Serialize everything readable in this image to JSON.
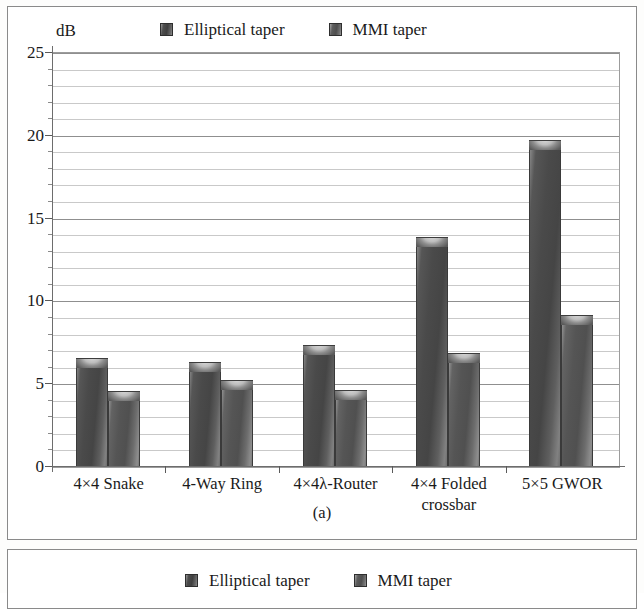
{
  "figure": {
    "subfigure_caption": "(a)",
    "unit_label": "dB"
  },
  "legend": {
    "entries": [
      {
        "label": "Elliptical taper",
        "swatch": "legend-swatch-elliptical",
        "color": "#4a4a4a"
      },
      {
        "label": "MMI taper",
        "swatch": "legend-swatch-mmi",
        "color": "#555555"
      }
    ]
  },
  "panel_b": {
    "legend": {
      "entries": [
        {
          "label": "Elliptical taper",
          "color": "#4a4a4a"
        },
        {
          "label": "MMI taper",
          "color": "#555555"
        }
      ]
    }
  },
  "chart_data": {
    "type": "bar",
    "title": "",
    "subtitle": "",
    "xlabel": "",
    "ylabel": "dB",
    "ylim": [
      0,
      25
    ],
    "yticks": [
      0,
      5,
      10,
      15,
      20,
      25
    ],
    "ytick_labels": [
      "0",
      "5",
      "10",
      "15",
      "20",
      "25"
    ],
    "minor_tick_interval": 1,
    "grid": true,
    "legend_position": "top",
    "categories": [
      "4×4 Snake",
      "4-Way Ring",
      "4×4λ-Router",
      "4×4 Folded crossbar",
      "5×5 GWOR"
    ],
    "category_lines": [
      [
        "4×4 Snake"
      ],
      [
        "4-Way Ring"
      ],
      [
        "4×4λ-Router"
      ],
      [
        "4×4 Folded",
        "crossbar"
      ],
      [
        "5×5 GWOR"
      ]
    ],
    "series": [
      {
        "name": "Elliptical taper",
        "values": [
          6.5,
          6.3,
          7.3,
          13.8,
          19.7
        ]
      },
      {
        "name": "MMI taper",
        "values": [
          4.5,
          5.2,
          4.6,
          6.8,
          9.1
        ]
      }
    ]
  }
}
